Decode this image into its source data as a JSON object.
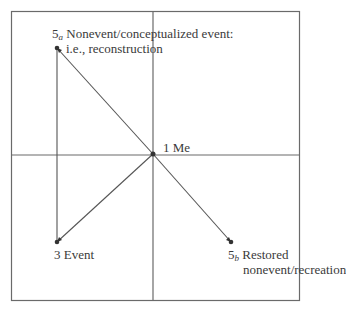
{
  "diagram": {
    "type": "quadrant-network",
    "colors": {
      "line": "#6a6a6a",
      "point": "#333333",
      "text": "#3a3a3a",
      "background": "#ffffff"
    },
    "nodes": [
      {
        "id": "1",
        "number": "1",
        "subscript": "",
        "label": "Me",
        "x": 153,
        "y": 154
      },
      {
        "id": "3",
        "number": "3",
        "subscript": "",
        "label": "Event",
        "x": 57,
        "y": 242
      },
      {
        "id": "5a",
        "number": "5",
        "subscript": "a",
        "label": "Nonevent/conceptualized event:",
        "label_line2": "i.e., reconstruction",
        "x": 57,
        "y": 48
      },
      {
        "id": "5b",
        "number": "5",
        "subscript": "b",
        "label": "Restored",
        "label_line2": "nonevent/recreation",
        "x": 231,
        "y": 242
      }
    ],
    "edges": [
      {
        "from": "5a",
        "to": "1",
        "arrow": "5a"
      },
      {
        "from": "1",
        "to": "3",
        "arrow": "3"
      },
      {
        "from": "3",
        "to": "5a",
        "arrow": "none"
      },
      {
        "from": "1",
        "to": "5b",
        "arrow": "5b"
      }
    ]
  }
}
